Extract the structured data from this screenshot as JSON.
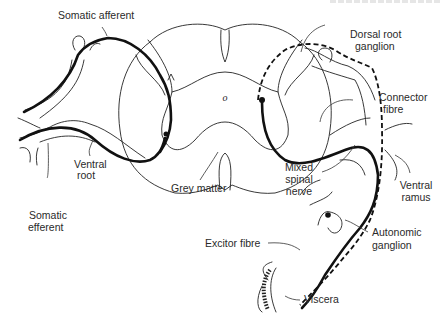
{
  "figure": {
    "colors": {
      "line": "#111111",
      "background": "#ffffff",
      "text": "#2a2a2a"
    }
  },
  "labels": {
    "somatic_afferent": "Somatic afferent",
    "dorsal_root_ganglion_1": "Dorsal root",
    "dorsal_root_ganglion_2": "ganglion",
    "connector_fibre_1": "Connector",
    "connector_fibre_2": "fibre",
    "ventral_root_1": "Ventral",
    "ventral_root_2": "root",
    "grey_matter": "Grey matter",
    "mixed_spinal_nerve_1": "Mixed",
    "mixed_spinal_nerve_2": "spinal",
    "mixed_spinal_nerve_3": "nerve",
    "ventral_ramus_1": "Ventral",
    "ventral_ramus_2": "ramus",
    "somatic_efferent_1": "Somatic",
    "somatic_efferent_2": "efferent",
    "autonomic_ganglion_1": "Autonomic",
    "autonomic_ganglion_2": "ganglion",
    "excitor_fibre": "Excitor fibre",
    "viscera": "Viscera",
    "central_canal": "o"
  }
}
